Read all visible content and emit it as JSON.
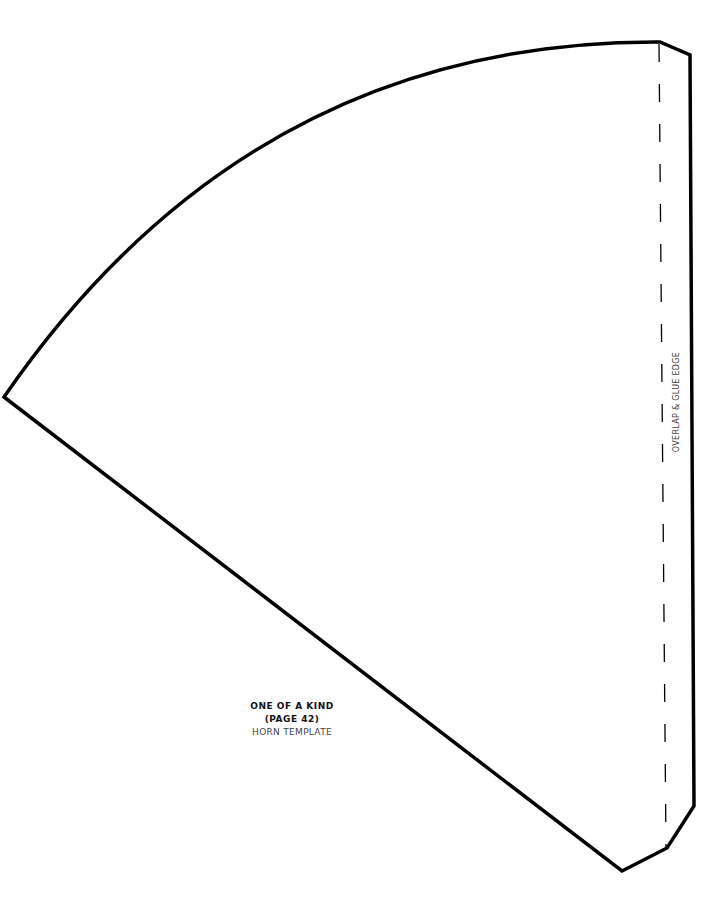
{
  "template": {
    "title": "ONE OF A KIND",
    "page_ref": "(PAGE 42)",
    "subtitle": "HORN TEMPLATE",
    "glue_label": "OVERLAP & GLUE EDGE"
  },
  "colors": {
    "stroke": "#000000",
    "background": "#ffffff"
  }
}
